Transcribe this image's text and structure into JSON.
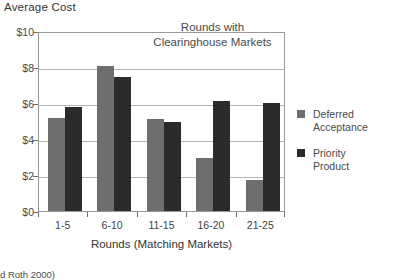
{
  "chart_data": {
    "type": "bar",
    "title": "Average Cost",
    "xlabel": "Rounds (Matching Markets)",
    "ylabel": "Average Cost",
    "categories": [
      "1-5",
      "6-10",
      "11-15",
      "16-20",
      "21-25"
    ],
    "series": [
      {
        "name": "Deferred Acceptance",
        "color": "#6e6e6e",
        "values": [
          5.15,
          8.05,
          5.1,
          2.95,
          1.75
        ]
      },
      {
        "name": "Priority Product",
        "color": "#2b2b2b",
        "values": [
          5.8,
          7.45,
          4.95,
          6.1,
          6.0
        ]
      }
    ],
    "ylim": [
      0,
      10
    ],
    "ytick_values": [
      0,
      2,
      4,
      6,
      8,
      10
    ],
    "ytick_labels": [
      "$0",
      "$2",
      "$4",
      "$6",
      "$8",
      "$10"
    ],
    "grid": true,
    "legend_position": "right",
    "annotations": [
      {
        "name": "clearinghouse-note",
        "lines": [
          "Rounds with",
          "Clearinghouse Markets"
        ]
      }
    ]
  },
  "footer": {
    "caption": "d Roth 2000)"
  }
}
